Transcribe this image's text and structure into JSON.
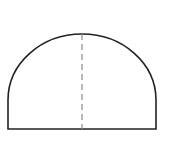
{
  "diagram": {
    "type": "geometry",
    "canvas": {
      "width": 172,
      "height": 144,
      "background": "#ffffff"
    },
    "shape": {
      "base_left_x": 8,
      "base_right_x": 156,
      "base_y": 129,
      "center_x": 82,
      "arc_center_y": 100,
      "arc_radius_x": 74,
      "arc_radius_y": 66,
      "stroke_color": "#222222",
      "stroke_width": 1.6
    },
    "center_line": {
      "x": 82,
      "y_top": 34,
      "y_bottom": 129,
      "style": "dashed",
      "dash": "6 4",
      "stroke_color": "#8a8a8a",
      "stroke_width": 1.2
    }
  }
}
